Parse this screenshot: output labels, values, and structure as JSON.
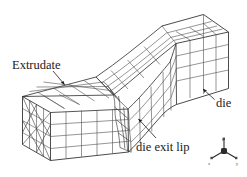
{
  "figure": {
    "background_color": "#ffffff",
    "line_color": "#4a4a4a",
    "line_color_dark": "#1f1f1f",
    "text_color": "#1a1a1a",
    "width": 247,
    "height": 177
  },
  "annotations": {
    "extrudate": {
      "label": "Extrudate",
      "leader": "arrow pointing down-right to the extrudate top surface"
    },
    "die": {
      "label": "die",
      "leader": "arrow pointing up-left to the die block side face"
    },
    "die_exit_lip": {
      "label": "die exit lip",
      "leader": "arrow pointing up-left to the mesh neck region"
    }
  },
  "axis_triad": {
    "name": "coordinate-axis-triad",
    "z": "z",
    "x": "x",
    "y": "y",
    "hub_color": "#2b2b2b"
  },
  "mesh": {
    "description": "Three-dimensional structured hexahedral mesh of a rectangular extrudate emerging from a rectangular die, shown in isometric projection.",
    "regions": [
      {
        "name": "extrudate",
        "position": "left",
        "divisions_across": 4,
        "divisions_deep": 4,
        "divisions_along": 5
      },
      {
        "name": "die",
        "position": "right",
        "divisions_across": 4,
        "divisions_deep": 4,
        "divisions_along": 4
      }
    ],
    "end_face_diagonals": true
  }
}
